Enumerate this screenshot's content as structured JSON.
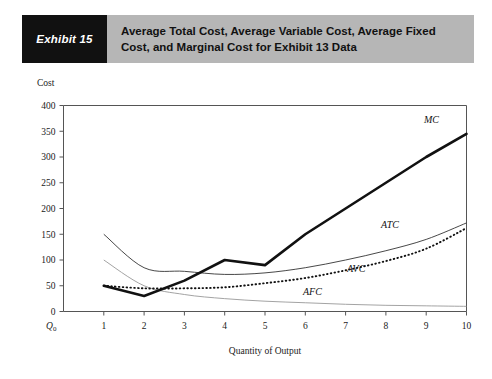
{
  "header": {
    "tag": "Exhibit 15",
    "title_line1": "Average Total Cost, Average Variable Cost, Average Fixed",
    "title_line2": "Cost, and Marginal Cost for Exhibit 13 Data",
    "tag_background": "#111111",
    "banner_background": "#b6b6b6"
  },
  "chart_data": {
    "type": "line",
    "title": "Average Total Cost, Average Variable Cost, Average Fixed Cost, and Marginal Cost for Exhibit 13 Data",
    "xlabel": "Quantity of Output",
    "ylabel": "Cost",
    "origin_label": "Q0",
    "origin_label_base": "Q",
    "origin_label_sub": "0",
    "grid": false,
    "legend": "inline-curve-labels",
    "xlim": [
      0,
      10
    ],
    "ylim": [
      0,
      400
    ],
    "x": [
      1,
      2,
      3,
      4,
      5,
      6,
      7,
      8,
      9,
      10
    ],
    "yticks": [
      0,
      50,
      100,
      150,
      200,
      250,
      300,
      350,
      400
    ],
    "xticks": [
      1,
      2,
      3,
      4,
      5,
      6,
      7,
      8,
      9,
      10
    ],
    "series": [
      {
        "name": "MC",
        "label": "MC",
        "style": "thick-solid",
        "color": "#111111",
        "values": [
          50,
          30,
          60,
          100,
          90,
          150,
          200,
          250,
          300,
          345
        ]
      },
      {
        "name": "ATC",
        "label": "ATC",
        "style": "thin-solid",
        "color": "#333333",
        "values": [
          150,
          85,
          78,
          72,
          75,
          85,
          100,
          118,
          140,
          172
        ]
      },
      {
        "name": "AVC",
        "label": "AVC",
        "style": "dotted",
        "color": "#111111",
        "values": [
          50,
          45,
          45,
          47,
          55,
          65,
          80,
          98,
          122,
          162
        ]
      },
      {
        "name": "AFC",
        "label": "AFC",
        "style": "thin-gray",
        "color": "#999999",
        "values": [
          100,
          50,
          33,
          25,
          20,
          17,
          14,
          12,
          11,
          10
        ]
      }
    ]
  }
}
